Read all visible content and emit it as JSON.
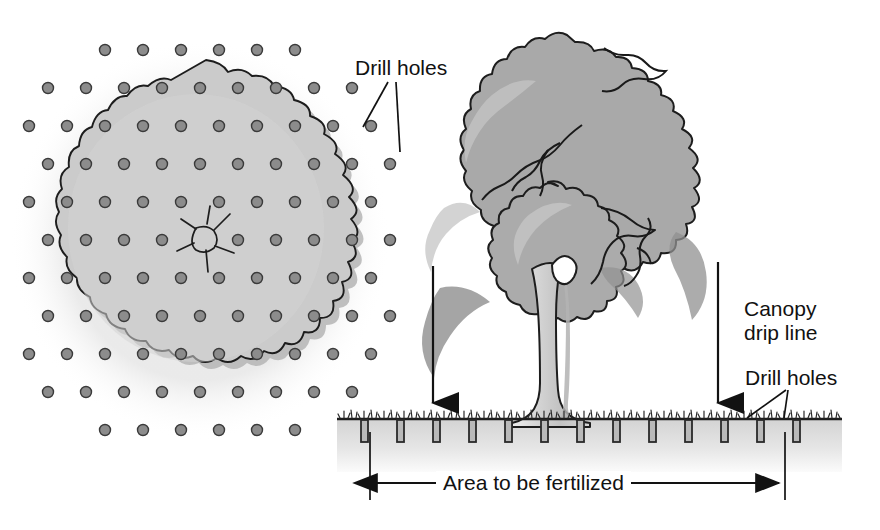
{
  "figure": {
    "views": [
      {
        "name": "plan-view",
        "description": "Overhead view of tree canopy with grid of drill holes"
      },
      {
        "name": "elevation-view",
        "description": "Side view of tree showing canopy drip line and drill holes in soil"
      }
    ]
  },
  "labels": {
    "drill_holes_plan": "Drill holes",
    "canopy_drip_line": "Canopy\ndrip line",
    "drill_holes_elevation": "Drill holes",
    "area_to_be_fertilized": "Area to be fertilized"
  },
  "colors": {
    "ink": "#111111",
    "outline": "#1c1c1c",
    "canopy_plan_fill": "#c9c9c9",
    "canopy_plan_shadow": "#b4b4b4",
    "canopy_fill": "#a9a9a9",
    "canopy_highlight": "#c2c2c2",
    "canopy_shadow": "#939393",
    "trunk_fill": "#d2d2d2",
    "trunk_shadow": "#b6b6b6",
    "soil_fill": "#e3e3e3",
    "dot_fill": "#8c8c8c",
    "dot_stroke": "#3a3a3a",
    "hole_fill": "#b9b9b9",
    "hole_stroke": "#2a2a2a",
    "background": "#ffffff"
  },
  "plan_view": {
    "center": {
      "x": 200,
      "y": 240
    },
    "trunk_marker": "trunk-cross-section",
    "dot_grid": {
      "spacing_x": 38,
      "spacing_y": 38,
      "stagger": true,
      "dot_radius": 5.5,
      "count_visible": 78
    }
  },
  "elevation_view": {
    "ground_line_y": 419,
    "soil_depth": 52,
    "drip_line_left_x": 433,
    "drip_line_right_x": 718,
    "arrows": [
      {
        "name": "drip-line-arrow-left",
        "x": 433,
        "from_y": 266,
        "to_y": 415
      },
      {
        "name": "drip-line-arrow-right",
        "x": 718,
        "from_y": 262,
        "to_y": 415
      }
    ],
    "dimension_line": {
      "left_x": 370,
      "right_x": 785,
      "y": 489
    },
    "drill_holes": {
      "count": 16,
      "first_x": 361,
      "spacing": 36,
      "width": 7,
      "depth": 22,
      "callout_targets": [
        745,
        783
      ]
    }
  }
}
